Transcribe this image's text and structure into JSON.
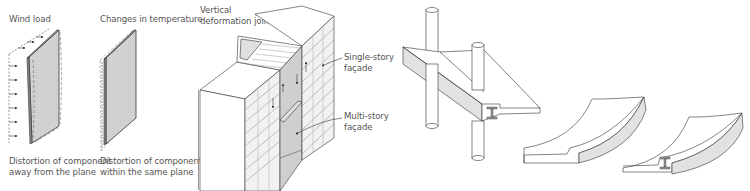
{
  "figure": {
    "panels": [
      {
        "id": "wind-load",
        "title": "Wind load",
        "caption_line1": "Distortion of component",
        "caption_line2": "away from the plane"
      },
      {
        "id": "temperature",
        "title": "Changes in temperature",
        "caption_line1": "Distortion of component",
        "caption_line2": "within the same plane"
      },
      {
        "id": "facade-joint",
        "labels": {
          "joint_line1": "Vertical",
          "joint_line2": "deformation joint",
          "single_line1": "Single-story",
          "single_line2": "façade",
          "multi_line1": "Multi-story",
          "multi_line2": "façade"
        }
      },
      {
        "id": "slab-beams",
        "description": "Floor slab with steel I-beam and columns; curved deflected slab elements"
      }
    ],
    "colors": {
      "line": "#333333",
      "panel_fill": "#d9d9d9",
      "shade_fill": "#e2e2e2",
      "text": "#555555",
      "dashed": "#888888"
    }
  }
}
